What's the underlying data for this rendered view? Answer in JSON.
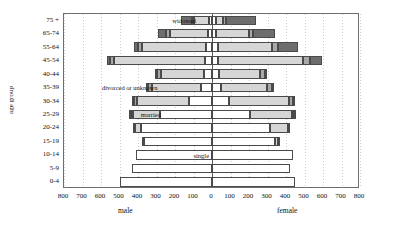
{
  "chart_data": {
    "type": "bar",
    "subtype": "population-pyramid-stacked",
    "title": "",
    "xlabel": "",
    "ylabel": "age group",
    "side_labels": {
      "left": "male",
      "right": "female"
    },
    "categories": [
      "75 +",
      "65-74",
      "55-64",
      "45-54",
      "40-44",
      "35-39",
      "30-34",
      "25-29",
      "20-24",
      "15-19",
      "10-14",
      "5-9",
      "0-4"
    ],
    "xlim": [
      -800,
      800
    ],
    "xticks": [
      800,
      700,
      600,
      500,
      400,
      300,
      200,
      100,
      0,
      100,
      200,
      300,
      400,
      500,
      600,
      700,
      800
    ],
    "xtick_values": [
      -800,
      -700,
      -600,
      -500,
      -400,
      -300,
      -200,
      -100,
      0,
      100,
      200,
      300,
      400,
      500,
      600,
      700,
      800
    ],
    "grid": true,
    "legend_position": "inline-annotations",
    "series": [
      {
        "name": "single",
        "color": "#ffffff"
      },
      {
        "name": "married",
        "color": "#d6d6d6"
      },
      {
        "name": "divorced or unknown",
        "color": "#a8a8a8"
      },
      {
        "name": "widowed",
        "color": "#6d6d6d"
      }
    ],
    "annotations": [
      {
        "text": "widowed",
        "x": -215,
        "row": "75 +"
      },
      {
        "text": "divorced or unknown",
        "x": -595,
        "row": "35-39"
      },
      {
        "text": "married",
        "x": -385,
        "row": "25-29"
      },
      {
        "text": "single",
        "x": -100,
        "row": "10-14"
      }
    ],
    "rows": [
      {
        "age": "75 +",
        "male": {
          "single": 18,
          "married": 78,
          "divorced": 14,
          "widowed": 55,
          "total": 165
        },
        "female": {
          "single": 22,
          "married": 40,
          "divorced": 12,
          "widowed": 165,
          "total": 239
        }
      },
      {
        "age": "65-74",
        "male": {
          "single": 22,
          "married": 205,
          "divorced": 20,
          "widowed": 45,
          "total": 292
        },
        "female": {
          "single": 22,
          "married": 178,
          "divorced": 22,
          "widowed": 120,
          "total": 342
        }
      },
      {
        "age": "55-64",
        "male": {
          "single": 30,
          "married": 350,
          "divorced": 22,
          "widowed": 22,
          "total": 424
        },
        "female": {
          "single": 30,
          "married": 295,
          "divorced": 30,
          "widowed": 110,
          "total": 465
        }
      },
      {
        "age": "45-54",
        "male": {
          "single": 38,
          "married": 490,
          "divorced": 26,
          "widowed": 14,
          "total": 568
        },
        "female": {
          "single": 34,
          "married": 460,
          "divorced": 38,
          "widowed": 62,
          "total": 594
        }
      },
      {
        "age": "40-44",
        "male": {
          "single": 46,
          "married": 232,
          "divorced": 22,
          "widowed": 6,
          "total": 306
        },
        "female": {
          "single": 40,
          "married": 222,
          "divorced": 26,
          "widowed": 10,
          "total": 298
        }
      },
      {
        "age": "35-39",
        "male": {
          "single": 62,
          "married": 268,
          "divorced": 22,
          "widowed": 4,
          "total": 356
        },
        "female": {
          "single": 52,
          "married": 252,
          "divorced": 26,
          "widowed": 6,
          "total": 336
        }
      },
      {
        "age": "30-34",
        "male": {
          "single": 128,
          "married": 286,
          "divorced": 18,
          "widowed": 2,
          "total": 434
        },
        "female": {
          "single": 92,
          "married": 330,
          "divorced": 22,
          "widowed": 4,
          "total": 448
        }
      },
      {
        "age": "25-29",
        "male": {
          "single": 290,
          "married": 150,
          "divorced": 8,
          "widowed": 1,
          "total": 449
        },
        "female": {
          "single": 208,
          "married": 232,
          "divorced": 10,
          "widowed": 2,
          "total": 452
        }
      },
      {
        "age": "20-24",
        "male": {
          "single": 390,
          "married": 36,
          "divorced": 2,
          "widowed": 0,
          "total": 428
        },
        "female": {
          "single": 318,
          "married": 100,
          "divorced": 4,
          "widowed": 0,
          "total": 422
        }
      },
      {
        "age": "15-19",
        "male": {
          "single": 378,
          "married": 2,
          "divorced": 0,
          "widowed": 0,
          "total": 380
        },
        "female": {
          "single": 352,
          "married": 12,
          "divorced": 1,
          "widowed": 0,
          "total": 365
        }
      },
      {
        "age": "10-14",
        "male": {
          "single": 410,
          "married": 0,
          "divorced": 0,
          "widowed": 0,
          "total": 410
        },
        "female": {
          "single": 440,
          "married": 0,
          "divorced": 0,
          "widowed": 0,
          "total": 440
        }
      },
      {
        "age": "5-9",
        "male": {
          "single": 430,
          "married": 0,
          "divorced": 0,
          "widowed": 0,
          "total": 430
        },
        "female": {
          "single": 422,
          "married": 0,
          "divorced": 0,
          "widowed": 0,
          "total": 422
        }
      },
      {
        "age": "0-4",
        "male": {
          "single": 498,
          "married": 0,
          "divorced": 0,
          "widowed": 0,
          "total": 498
        },
        "female": {
          "single": 450,
          "married": 0,
          "divorced": 0,
          "widowed": 0,
          "total": 450
        }
      }
    ]
  }
}
